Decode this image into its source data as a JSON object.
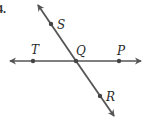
{
  "problem_number": "4.",
  "colors": {
    "line": "#555555",
    "point": "#444444",
    "text": "#2a2a2a"
  },
  "diagram": {
    "lines": [
      {
        "name": "line-TP",
        "through": [
          "T",
          "Q",
          "P"
        ],
        "orientation": "horizontal",
        "arrows": "both"
      },
      {
        "name": "line-SR",
        "through": [
          "S",
          "Q",
          "R"
        ],
        "orientation": "diagonal",
        "arrows": "both"
      }
    ],
    "points": {
      "S": {
        "label": "S"
      },
      "T": {
        "label": "T"
      },
      "Q": {
        "label": "Q"
      },
      "P": {
        "label": "P"
      },
      "R": {
        "label": "R"
      }
    },
    "intersection": "Q"
  }
}
